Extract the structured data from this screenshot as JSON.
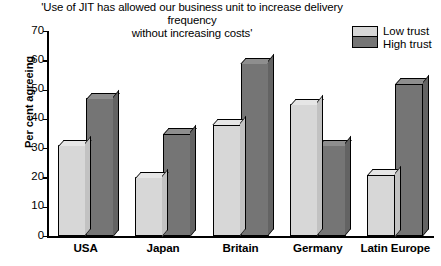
{
  "chart_data": {
    "type": "bar",
    "title": "'Use of JIT has allowed our business unit to increase delivery frequency without increasing costs'",
    "title_line1": "'Use of JIT has allowed our business unit to increase delivery frequency",
    "title_line2": "without increasing costs'",
    "xlabel": "",
    "ylabel": "Per cent agreeing",
    "ylim": [
      0,
      70
    ],
    "yticks": [
      0,
      10,
      20,
      30,
      40,
      50,
      60,
      70
    ],
    "grid": false,
    "legend_position": "top-right",
    "categories": [
      "USA",
      "Japan",
      "Britain",
      "Germany",
      "Latin Europe"
    ],
    "series": [
      {
        "name": "Low trust",
        "color": "#d7d7d7",
        "values": [
          31,
          20,
          38,
          45,
          21
        ]
      },
      {
        "name": "High trust",
        "color": "#757575",
        "values": [
          47,
          35,
          59,
          31,
          52
        ]
      }
    ]
  }
}
